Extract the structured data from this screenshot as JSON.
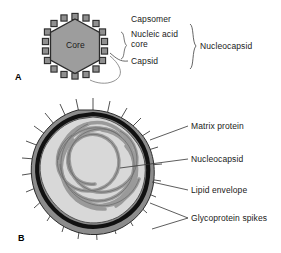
{
  "figure": {
    "colors": {
      "capsid_fill": "#9d9d9d",
      "capsomer_fill": "#8f8f8f",
      "outline": "#2b2b2b",
      "envelope_black": "#111111",
      "matrix_gray": "#8c8c8c",
      "interior_gray": "#d8d8d8",
      "nucleocapsid_strand": "#b0b0b0",
      "text": "#1a1a1a",
      "background": "#ffffff"
    }
  },
  "panel_a": {
    "letter": "A",
    "core_label": "Core",
    "labels": {
      "capsomer": "Capsomer",
      "nucleic_acid_core_line1": "Nucleic acid",
      "nucleic_acid_core_line2": "core",
      "capsid": "Capsid",
      "nucleocapsid": "Nucleocapsid"
    }
  },
  "panel_b": {
    "letter": "B",
    "labels": {
      "matrix_protein": "Matrix protein",
      "nucleocapsid": "Nucleocapsid",
      "lipid_envelope": "Lipid envelope",
      "glycoprotein_spikes": "Glycoprotein spikes"
    }
  }
}
